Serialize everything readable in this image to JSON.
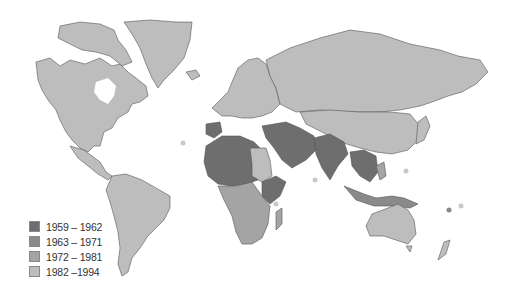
{
  "map": {
    "type": "choropleth world map",
    "colors": {
      "background": "#ffffff",
      "border": "#555555",
      "period_1959_1962": "#6e6e6e",
      "period_1963_1971": "#8a8a8a",
      "period_1972_1981": "#a4a4a4",
      "period_1982_1994": "#bdbdbd"
    }
  },
  "legend": {
    "items": [
      {
        "label": "1959 – 1962",
        "color": "#6e6e6e"
      },
      {
        "label": "1963 – 1971",
        "color": "#8a8a8a"
      },
      {
        "label": "1972 – 1981",
        "color": "#a4a4a4"
      },
      {
        "label": "1982 –1994",
        "color": "#bdbdbd"
      }
    ]
  }
}
